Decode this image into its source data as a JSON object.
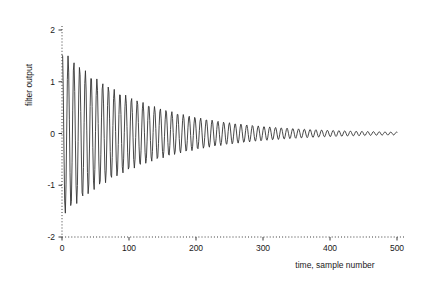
{
  "chart_data": {
    "type": "line",
    "title": "",
    "xlabel": "time, sample number",
    "ylabel": "filter output",
    "xlim": [
      0,
      500
    ],
    "ylim": [
      -2,
      2
    ],
    "xticks": [
      0,
      100,
      200,
      300,
      400,
      500
    ],
    "yticks": [
      -2,
      -1,
      0,
      1,
      2
    ],
    "xtick_labels": [
      "0",
      "100",
      "200",
      "300",
      "400",
      "500"
    ],
    "ytick_labels": [
      "-2",
      "-1",
      "0",
      "1",
      "2"
    ],
    "grid": false,
    "legend": null,
    "axis_style": "dotted",
    "line_color": "#333333",
    "line_width": 0.9,
    "series": [
      {
        "name": "filter output",
        "model": "damped_sinusoid",
        "amplitude": 1.62,
        "decay_constant": 122,
        "period_samples": 8.6,
        "phase_rad": 1.2,
        "n_points": 501,
        "x_start": 0,
        "x_end": 500,
        "envelope_samples": [
          {
            "x": 0,
            "amp": 1.62
          },
          {
            "x": 10,
            "amp": 1.49
          },
          {
            "x": 25,
            "amp": 1.32
          },
          {
            "x": 50,
            "amp": 1.08
          },
          {
            "x": 75,
            "amp": 0.88
          },
          {
            "x": 100,
            "amp": 0.72
          },
          {
            "x": 150,
            "amp": 0.48
          },
          {
            "x": 176,
            "amp": 0.39
          },
          {
            "x": 200,
            "amp": 0.32
          },
          {
            "x": 250,
            "amp": 0.21
          },
          {
            "x": 295,
            "amp": 0.15
          },
          {
            "x": 300,
            "amp": 0.14
          },
          {
            "x": 350,
            "amp": 0.1
          },
          {
            "x": 400,
            "amp": 0.064
          },
          {
            "x": 450,
            "amp": 0.043
          },
          {
            "x": 500,
            "amp": 0.029
          }
        ]
      }
    ]
  }
}
